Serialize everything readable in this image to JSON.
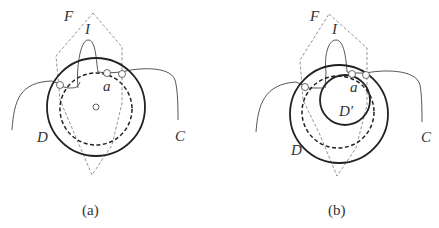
{
  "panels": [
    {
      "caption": "(a)",
      "labels": {
        "F": "F",
        "I": "I",
        "a": "a",
        "D": "D",
        "C": "C"
      }
    },
    {
      "caption": "(b)",
      "labels": {
        "F": "F",
        "I": "I",
        "a": "a",
        "D": "D",
        "Dprime": "D′",
        "C": "C"
      }
    }
  ],
  "colors": {
    "stroke": "#333333",
    "dashed_polygon": "#777777",
    "background": "#ffffff"
  }
}
